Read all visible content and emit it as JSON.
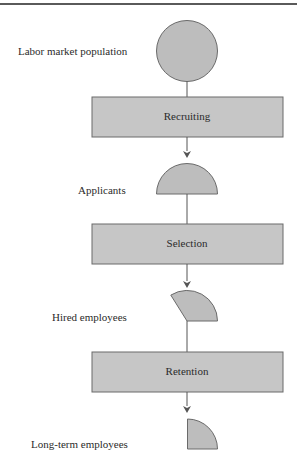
{
  "diagram": {
    "type": "flowchart",
    "orientation": "vertical",
    "colors": {
      "shape_fill": "#bdbdbd",
      "box_fill": "#c6c6c6",
      "stroke": "#6a6a6a",
      "line": "#555555",
      "text": "#2b2b2b"
    },
    "stages": [
      {
        "id": "labor-market-population",
        "label": "Labor market population",
        "shape": "circle"
      },
      {
        "id": "recruiting",
        "label": "Recruiting",
        "shape": "process-box"
      },
      {
        "id": "applicants",
        "label": "Applicants",
        "shape": "half-circle"
      },
      {
        "id": "selection",
        "label": "Selection",
        "shape": "process-box"
      },
      {
        "id": "hired-employees",
        "label": "Hired employees",
        "shape": "sector"
      },
      {
        "id": "retention",
        "label": "Retention",
        "shape": "process-box"
      },
      {
        "id": "long-term-employees",
        "label": "Long-term employees",
        "shape": "quarter-circle"
      }
    ]
  },
  "labels": {
    "labor_market_population": "Labor market population",
    "recruiting": "Recruiting",
    "applicants": "Applicants",
    "selection": "Selection",
    "hired_employees": "Hired employees",
    "retention": "Retention",
    "long_term_employees": "Long-term employees"
  }
}
